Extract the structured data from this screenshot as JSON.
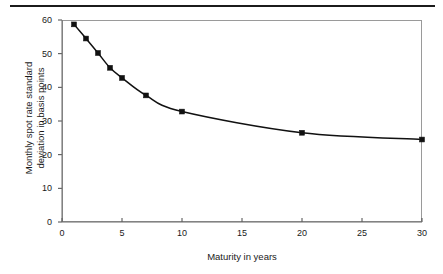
{
  "figure": {
    "top_rule": "horizontal-rule"
  },
  "chart_data": {
    "type": "line",
    "title": "",
    "subtitle": "",
    "xlabel": "Maturity in years",
    "ylabel_line1": "Monthly spot rate standard",
    "ylabel_line2": "deviation in basis points",
    "ylabel": "Monthly spot rate standard deviation in basis points",
    "xlim": [
      0,
      30
    ],
    "ylim": [
      0,
      60
    ],
    "xticks": [
      0,
      5,
      10,
      15,
      20,
      25,
      30
    ],
    "yticks": [
      0,
      10,
      20,
      30,
      40,
      50,
      60
    ],
    "xtick_labels": [
      "0",
      "5",
      "10",
      "15",
      "20",
      "25",
      "30"
    ],
    "ytick_labels": [
      "0",
      "10",
      "20",
      "30",
      "40",
      "50",
      "60"
    ],
    "grid": false,
    "legend": null,
    "marker": "filled-square",
    "line_color": "#111111",
    "marker_color": "#111111",
    "series": [
      {
        "name": "Monthly spot rate standard deviation",
        "x": [
          1,
          2,
          3,
          4,
          5,
          7,
          10,
          20,
          30
        ],
        "values": [
          58.7,
          54.5,
          50.2,
          45.8,
          42.8,
          37.6,
          32.8,
          26.5,
          24.5
        ]
      }
    ]
  }
}
